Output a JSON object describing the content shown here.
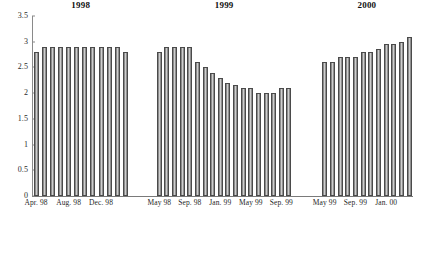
{
  "chart_data": {
    "type": "bar",
    "title": "",
    "xlabel": "",
    "ylabel": "",
    "ylim": [
      0,
      3.5
    ],
    "ytick_labels": [
      "0",
      "0.5",
      "1",
      "1.5",
      "2",
      "2.5",
      "3",
      "3.5"
    ],
    "ytick_values": [
      0,
      0.5,
      1,
      1.5,
      2,
      2.5,
      3,
      3.5
    ],
    "grid": false,
    "legend": "none",
    "panels": [
      {
        "title": "1998",
        "tick_labels": [
          "Apr. 98",
          "Aug. 98",
          "Dec. 98"
        ],
        "tick_positions": [
          0,
          4,
          8
        ],
        "categories": [
          "Apr. 98",
          "May 98",
          "Jun. 98",
          "Jul. 98",
          "Aug. 98",
          "Sep. 98",
          "Oct. 98",
          "Nov. 98",
          "Dec. 98",
          "Jan. 99",
          "Feb. 99",
          "Mar. 99"
        ],
        "values": [
          2.8,
          2.9,
          2.9,
          2.9,
          2.9,
          2.9,
          2.9,
          2.9,
          2.9,
          2.9,
          2.9,
          2.8
        ]
      },
      {
        "title": "1999",
        "tick_labels": [
          "May 98",
          "Sep. 98",
          "Jan. 99",
          "May 99",
          "Sep. 99"
        ],
        "tick_positions": [
          0,
          4,
          8,
          12,
          16
        ],
        "categories": [
          "May 98",
          "Jun. 98",
          "Jul. 98",
          "Aug. 98",
          "Sep. 98",
          "Oct. 98",
          "Nov. 98",
          "Dec. 98",
          "Jan. 99",
          "Feb. 99",
          "Mar. 99",
          "Apr. 99",
          "May 99",
          "Jun. 99",
          "Jul. 99",
          "Aug. 99",
          "Sep. 99",
          "Oct. 99"
        ],
        "values": [
          2.8,
          2.9,
          2.9,
          2.9,
          2.9,
          2.6,
          2.5,
          2.4,
          2.3,
          2.2,
          2.15,
          2.1,
          2.1,
          2.0,
          2.0,
          2.0,
          2.1,
          2.1
        ]
      },
      {
        "title": "2000",
        "tick_labels": [
          "May 99",
          "Sep. 99",
          "Jan. 00"
        ],
        "tick_positions": [
          0,
          4,
          8
        ],
        "categories": [
          "May 99",
          "Jun. 99",
          "Jul. 99",
          "Aug. 99",
          "Sep. 99",
          "Oct. 99",
          "Nov. 99",
          "Dec. 99",
          "Jan. 00",
          "Feb. 00",
          "Mar. 00",
          "Apr. 00"
        ],
        "values": [
          2.6,
          2.6,
          2.7,
          2.7,
          2.7,
          2.8,
          2.8,
          2.85,
          2.95,
          2.95,
          3.0,
          3.1
        ]
      }
    ]
  }
}
